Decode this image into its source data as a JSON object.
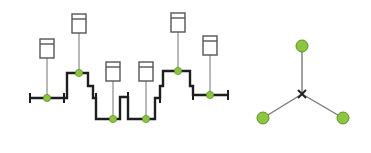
{
  "diagram": {
    "colors": {
      "background": "#ffffff",
      "bus_line": "#1e1e1e",
      "drop_line": "#8a8a8a",
      "node_fill": "#8cc63f",
      "node_stroke": "#5f8f2a",
      "box_stroke": "#555555",
      "box_fill": "#ffffff",
      "star_line": "#7a7a7a"
    },
    "left_topology": {
      "type": "stepped-bus",
      "nodes": [
        {
          "x": 47,
          "y": 98,
          "box": {
            "x": 38,
            "y": 39
          }
        },
        {
          "x": 79,
          "y": 73,
          "box": {
            "x": 72,
            "y": 14
          }
        },
        {
          "x": 113,
          "y": 119,
          "box": {
            "x": 105,
            "y": 62
          }
        },
        {
          "x": 146,
          "y": 119,
          "box": {
            "x": 138,
            "y": 62
          }
        },
        {
          "x": 178,
          "y": 71,
          "box": {
            "x": 170,
            "y": 13
          }
        },
        {
          "x": 210,
          "y": 95,
          "box": {
            "x": 202,
            "y": 36
          }
        }
      ]
    },
    "right_topology": {
      "type": "star",
      "center": {
        "x": 302,
        "y": 94
      },
      "nodes": [
        {
          "x": 302,
          "y": 46
        },
        {
          "x": 263,
          "y": 118
        },
        {
          "x": 343,
          "y": 118
        }
      ]
    }
  }
}
